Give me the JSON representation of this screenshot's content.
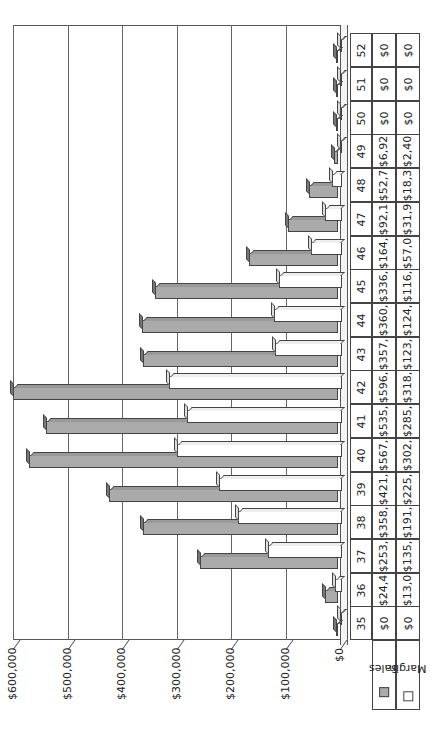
{
  "chart_data": {
    "type": "bar",
    "orientation_note": "3D clustered column chart with data table, rendered rotated 90 degrees counter-clockwise",
    "title": "",
    "xlabel": "",
    "ylabel": "",
    "ylim": [
      0,
      600000
    ],
    "yticks": [
      "$0",
      "$100,000",
      "$200,000",
      "$300,000",
      "$400,000",
      "$500,000",
      "$600,000"
    ],
    "grid": true,
    "legend_position": "data table",
    "categories": [
      "35",
      "36",
      "37",
      "38",
      "39",
      "40",
      "41",
      "42",
      "43",
      "44",
      "45",
      "46",
      "47",
      "48",
      "49",
      "50",
      "51",
      "52"
    ],
    "series": [
      {
        "name": "Sales",
        "color": "#aaaaaa",
        "values": [
          0,
          24400,
          253000,
          358000,
          421000,
          567000,
          535000,
          596000,
          357000,
          360000,
          336000,
          164000,
          92100,
          52700,
          6920,
          0,
          0,
          0
        ],
        "table_labels": [
          "$0",
          "$24,4",
          "$253,",
          "$358,",
          "$421,",
          "$567,",
          "$535,",
          "$596,",
          "$357,",
          "$360,",
          "$336,",
          "$164,",
          "$92,1",
          "$52,7",
          "$6,92",
          "$0",
          "$0",
          "$0"
        ]
      },
      {
        "name": "Margin",
        "color": "#ffffff",
        "values": [
          0,
          13000,
          135000,
          191000,
          225000,
          302000,
          285000,
          318000,
          123000,
          124000,
          116000,
          57000,
          31900,
          18300,
          2400,
          0,
          0,
          0
        ],
        "table_labels": [
          "$0",
          "$13,0",
          "$135,",
          "$191,",
          "$225,",
          "$302,",
          "$285,",
          "$318,",
          "$123,",
          "$124,",
          "$116,",
          "$57,0",
          "$31,9",
          "$18,3",
          "$2,40",
          "$0",
          "$0",
          "$0"
        ]
      }
    ]
  },
  "legend": {
    "sales_label": "Sales",
    "margin_label": "Margin"
  }
}
